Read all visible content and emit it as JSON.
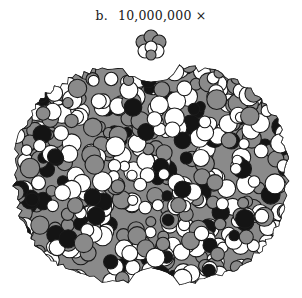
{
  "figure": {
    "label": "b.",
    "magnification": "10,000,000 ×"
  },
  "colors": {
    "dark": "#141414",
    "gray": "#8a8a8a",
    "light": "#ffffff",
    "outline": "#1a1a1a",
    "background": "#ffffff"
  },
  "molecule": {
    "small_fragment": {
      "cx": 151,
      "cy": 45,
      "r": 14
    },
    "body": {
      "left": 15,
      "right": 287,
      "top": 65,
      "bottom": 284,
      "top_notch_x": 150,
      "top_notch_depth": 18,
      "bottom_notch_x": 152,
      "bottom_notch_depth": 16
    },
    "atom_count": 520,
    "seed": 7,
    "color_mix": {
      "dark": 0.18,
      "gray": 0.37,
      "light": 0.45
    }
  }
}
